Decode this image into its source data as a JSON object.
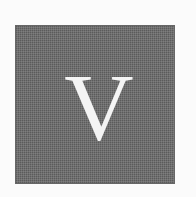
{
  "dropcap": {
    "letter": "V",
    "box_color": "#6f6f6f",
    "letter_color": "#f4f4f4"
  }
}
